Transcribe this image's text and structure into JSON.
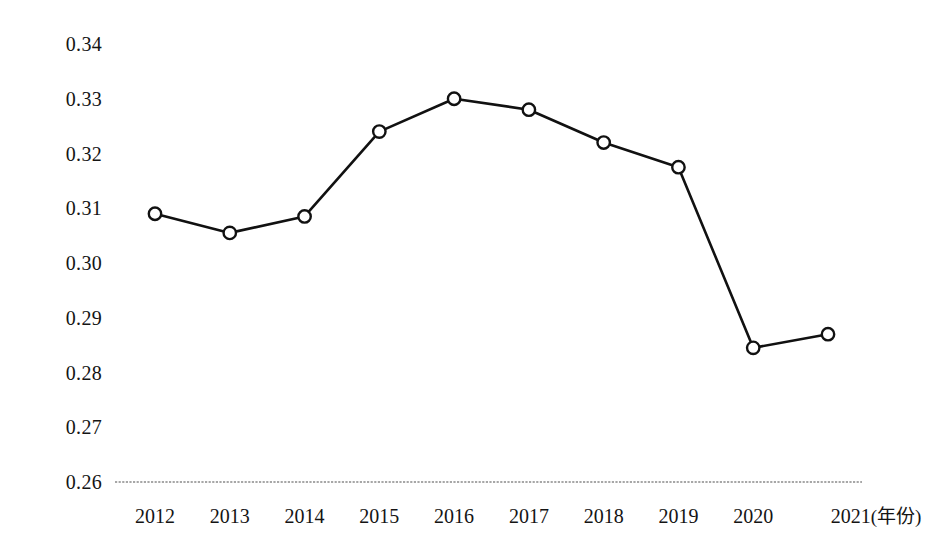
{
  "chart_data": {
    "type": "line",
    "title": "",
    "subtitle": "",
    "xlabel": "年份",
    "xlabel_display": "(年份)",
    "ylabel": "",
    "categories": [
      "2012",
      "2013",
      "2014",
      "2015",
      "2016",
      "2017",
      "2018",
      "2019",
      "2020",
      "2021"
    ],
    "x": [
      2012,
      2013,
      2014,
      2015,
      2016,
      2017,
      2018,
      2019,
      2020,
      2021
    ],
    "values": [
      0.309,
      0.3055,
      0.3085,
      0.324,
      0.33,
      0.328,
      0.322,
      0.3175,
      0.2845,
      0.287
    ],
    "series": [
      {
        "name": "",
        "values": [
          0.309,
          0.3055,
          0.3085,
          0.324,
          0.33,
          0.328,
          0.322,
          0.3175,
          0.2845,
          0.287
        ]
      }
    ],
    "ylim": [
      0.26,
      0.34
    ],
    "ytick_values": [
      0.34,
      0.33,
      0.32,
      0.31,
      0.3,
      0.29,
      0.28,
      0.27,
      0.26
    ],
    "ytick_labels": [
      "0.34",
      "0.33",
      "0.32",
      "0.31",
      "0.30",
      "0.29",
      "0.28",
      "0.27",
      "0.26"
    ],
    "ystep": 0.01,
    "grid": false,
    "baseline_at": 0.26,
    "legend": null,
    "legend_position": "none",
    "marker": "open-circle",
    "line_color": "#111111",
    "marker_fill": "#ffffff",
    "baseline_color": "#8a8a8a",
    "annotations": []
  },
  "axes": {
    "x_unit_label": "(年份)"
  }
}
